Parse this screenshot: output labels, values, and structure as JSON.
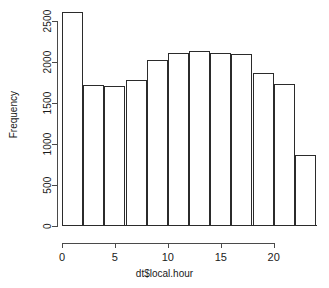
{
  "chart_data": {
    "type": "bar",
    "subtype": "histogram",
    "title": "",
    "xlabel": "dt$local.hour",
    "ylabel": "Frequency",
    "bin_width": 2,
    "bin_edges": [
      0,
      2,
      4,
      6,
      8,
      10,
      12,
      14,
      16,
      18,
      20,
      22,
      24
    ],
    "categories": [
      "0-2",
      "2-4",
      "4-6",
      "6-8",
      "8-10",
      "10-12",
      "12-14",
      "14-16",
      "16-18",
      "18-20",
      "20-22",
      "22-24"
    ],
    "bin_centers": [
      1,
      3,
      5,
      7,
      9,
      11,
      13,
      15,
      17,
      19,
      21,
      23
    ],
    "values": [
      2610,
      1715,
      1705,
      1780,
      2025,
      2115,
      2140,
      2110,
      2095,
      1865,
      1735,
      865
    ],
    "xlim": [
      0,
      24
    ],
    "ylim": [
      0,
      2700
    ],
    "xticks": [
      0,
      5,
      10,
      15,
      20
    ],
    "xtick_labels": [
      "0",
      "5",
      "10",
      "15",
      "20"
    ],
    "yticks": [
      0,
      500,
      1000,
      1500,
      2000,
      2500
    ],
    "ytick_labels": [
      "0",
      "500",
      "1000",
      "1500",
      "2000",
      "2500"
    ],
    "grid": false,
    "legend": false,
    "bar_fill": "#ffffff",
    "bar_border": "#2b2b2b",
    "axis_color": "#4a4a4a",
    "background": "#ffffff"
  }
}
